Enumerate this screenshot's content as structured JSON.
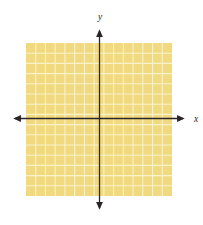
{
  "figure": {
    "x_axis_label": "x",
    "y_axis_label": "y",
    "grid": {
      "columns": 15,
      "rows": 15
    },
    "colors": {
      "region_fill": "#F0D97E",
      "grid_line": "#FAF2C9",
      "axis": "#2A2526",
      "background": "#FFFFFF"
    }
  },
  "chart_data": {
    "type": "area",
    "title": "",
    "xlabel": "x",
    "ylabel": "y",
    "x_range": [
      -7.5,
      7.5
    ],
    "y_range": [
      -7.5,
      7.5
    ],
    "grid": true,
    "legend": false,
    "series": [
      {
        "name": "shaded-region",
        "description": "entire visible coordinate plane shaded (all x, all y)",
        "fill": "#F0D97E"
      }
    ]
  }
}
